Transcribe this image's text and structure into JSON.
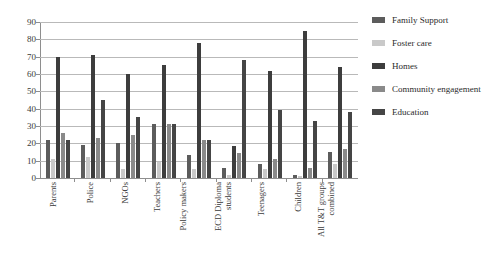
{
  "chart_data": {
    "type": "bar",
    "title": "",
    "xlabel": "",
    "ylabel": "",
    "ylim": [
      0,
      90
    ],
    "ytick_step": 10,
    "yticks": [
      90,
      80,
      70,
      60,
      50,
      40,
      30,
      20,
      10,
      0
    ],
    "grid": true,
    "legend_position": "right",
    "categories": [
      "Parents",
      "Police",
      "NGOs",
      "Teachers",
      "Policy makers",
      "ECD Diploma students",
      "Teenagers",
      "Children",
      "All T&T groups combined"
    ],
    "category_lines": [
      [
        "Parents"
      ],
      [
        "Police"
      ],
      [
        "NGOs"
      ],
      [
        "Teachers"
      ],
      [
        "Policy makers"
      ],
      [
        "ECD Diploma",
        "students"
      ],
      [
        "Teenagers"
      ],
      [
        "Children"
      ],
      [
        "All T&T groups",
        "combined"
      ]
    ],
    "series": [
      {
        "name": "Family Support",
        "color": "#5c5c5c",
        "values": [
          22,
          19,
          20,
          31,
          13,
          5.5,
          8,
          2,
          15
        ]
      },
      {
        "name": "Foster care",
        "color": "#c9c9c9",
        "values": [
          11,
          12,
          5,
          9,
          5,
          2,
          5,
          1,
          8
        ]
      },
      {
        "name": "Homes",
        "color": "#3d3d3d",
        "values": [
          70,
          71,
          60,
          65,
          78,
          18.5,
          62,
          85,
          64
        ]
      },
      {
        "name": "Community engagement",
        "color": "#8a8a8a",
        "values": [
          26,
          23,
          25,
          31,
          22,
          14.5,
          11,
          6,
          17
        ]
      },
      {
        "name": "Education",
        "color": "#454545",
        "values": [
          22,
          45,
          35,
          31,
          22,
          68,
          39,
          33,
          38
        ]
      }
    ]
  },
  "legend": {
    "items": [
      {
        "label": "Family Support",
        "color": "#5c5c5c"
      },
      {
        "label": "Foster care",
        "color": "#c9c9c9"
      },
      {
        "label": "Homes",
        "color": "#3d3d3d"
      },
      {
        "label": "Community engagement",
        "color": "#8a8a8a"
      },
      {
        "label": "Education",
        "color": "#454545"
      }
    ]
  },
  "axis": {
    "y_tick_labels": [
      "90",
      "80",
      "70",
      "60",
      "50",
      "40",
      "30",
      "20",
      "10",
      "0"
    ]
  }
}
